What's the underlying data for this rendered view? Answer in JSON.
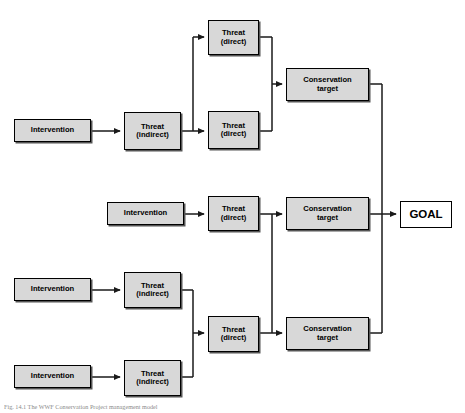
{
  "figure": {
    "caption": "Fig. 14.1  The WWF Conservation Project management model",
    "colors": {
      "node_fill": "#d8d8d8",
      "node_border": "#000000",
      "goal_fill": "#ffffff",
      "connector": "#1a1a1a",
      "background": "#ffffff",
      "caption_text": "#8a8a8a"
    }
  },
  "nodes": [
    {
      "id": "int-top",
      "label": "Intervention",
      "type": "intervention",
      "x": 14,
      "y": 119,
      "w": 77,
      "h": 23,
      "font": 7.6
    },
    {
      "id": "thr-ind-top",
      "label": "Threat\n(indirect)",
      "type": "threat-indirect",
      "x": 124,
      "y": 112,
      "w": 57,
      "h": 38,
      "font": 7.6
    },
    {
      "id": "thr-dir-1",
      "label": "Threat\n(direct)",
      "type": "threat-direct",
      "x": 208,
      "y": 20,
      "w": 51,
      "h": 35,
      "font": 7.6
    },
    {
      "id": "thr-dir-2",
      "label": "Threat\n(direct)",
      "type": "threat-direct",
      "x": 208,
      "y": 111,
      "w": 51,
      "h": 38,
      "font": 7.6
    },
    {
      "id": "cons-top",
      "label": "Conservation\ntarget",
      "type": "conservation-target",
      "x": 286,
      "y": 68,
      "w": 83,
      "h": 33,
      "font": 7.6
    },
    {
      "id": "int-mid",
      "label": "Intervention",
      "type": "intervention",
      "x": 107,
      "y": 202,
      "w": 77,
      "h": 23,
      "font": 7.6
    },
    {
      "id": "thr-dir-3",
      "label": "Threat\n(direct)",
      "type": "threat-direct",
      "x": 208,
      "y": 196,
      "w": 51,
      "h": 35,
      "font": 7.6
    },
    {
      "id": "cons-mid",
      "label": "Conservation\ntarget",
      "type": "conservation-target",
      "x": 286,
      "y": 197,
      "w": 83,
      "h": 33,
      "font": 7.6
    },
    {
      "id": "goal",
      "label": "GOAL",
      "type": "goal",
      "x": 400,
      "y": 201,
      "w": 52,
      "h": 27,
      "font": 11.5
    },
    {
      "id": "int-bot1",
      "label": "Intervention",
      "type": "intervention",
      "x": 14,
      "y": 278,
      "w": 77,
      "h": 23,
      "font": 7.6
    },
    {
      "id": "thr-ind-b1",
      "label": "Threat\n(indirect)",
      "type": "threat-indirect",
      "x": 124,
      "y": 272,
      "w": 57,
      "h": 36,
      "font": 7.6
    },
    {
      "id": "int-bot2",
      "label": "Intervention",
      "type": "intervention",
      "x": 14,
      "y": 365,
      "w": 77,
      "h": 23,
      "font": 7.6
    },
    {
      "id": "thr-ind-b2",
      "label": "Threat\n(indirect)",
      "type": "threat-indirect",
      "x": 124,
      "y": 360,
      "w": 57,
      "h": 36,
      "font": 7.6
    },
    {
      "id": "thr-dir-4",
      "label": "Threat\n(direct)",
      "type": "threat-direct",
      "x": 208,
      "y": 316,
      "w": 51,
      "h": 36,
      "font": 7.6
    },
    {
      "id": "cons-bot",
      "label": "Conservation\ntarget",
      "type": "conservation-target",
      "x": 286,
      "y": 317,
      "w": 83,
      "h": 33,
      "font": 7.6
    }
  ],
  "edges": [
    {
      "from": "int-top",
      "to": "thr-ind-top",
      "label": ""
    },
    {
      "from": "thr-ind-top",
      "to": "thr-dir-1",
      "label": ""
    },
    {
      "from": "thr-ind-top",
      "to": "thr-dir-2",
      "label": ""
    },
    {
      "from": "thr-dir-1",
      "to": "cons-top",
      "label": ""
    },
    {
      "from": "thr-dir-2",
      "to": "cons-top",
      "label": ""
    },
    {
      "from": "cons-top",
      "to": "goal",
      "label": ""
    },
    {
      "from": "int-mid",
      "to": "thr-dir-3",
      "label": ""
    },
    {
      "from": "thr-dir-3",
      "to": "cons-mid",
      "label": ""
    },
    {
      "from": "thr-dir-3",
      "to": "cons-bot",
      "label": ""
    },
    {
      "from": "cons-mid",
      "to": "goal",
      "label": ""
    },
    {
      "from": "int-bot1",
      "to": "thr-ind-b1",
      "label": ""
    },
    {
      "from": "int-bot2",
      "to": "thr-ind-b2",
      "label": ""
    },
    {
      "from": "thr-ind-b1",
      "to": "thr-dir-4",
      "label": ""
    },
    {
      "from": "thr-ind-b2",
      "to": "thr-dir-4",
      "label": ""
    },
    {
      "from": "thr-dir-4",
      "to": "cons-bot",
      "label": ""
    },
    {
      "from": "cons-bot",
      "to": "goal",
      "label": ""
    }
  ]
}
